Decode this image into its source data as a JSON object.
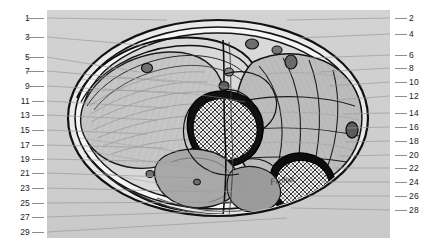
{
  "figure": {
    "signature": "Frohse",
    "plate_background_color": "#d0d0d0",
    "leader_line_color": "#8d8d8d",
    "label_text_color": "#222222",
    "page_background_color": "#ffffff"
  },
  "labels": {
    "left_column": [
      {
        "n": "1",
        "y": 18
      },
      {
        "n": "3",
        "y": 37
      },
      {
        "n": "5",
        "y": 57
      },
      {
        "n": "7",
        "y": 71
      },
      {
        "n": "9",
        "y": 86
      },
      {
        "n": "11",
        "y": 101
      },
      {
        "n": "13",
        "y": 115
      },
      {
        "n": "15",
        "y": 130
      },
      {
        "n": "17",
        "y": 145
      },
      {
        "n": "19",
        "y": 159
      },
      {
        "n": "21",
        "y": 173
      },
      {
        "n": "23",
        "y": 188
      },
      {
        "n": "25",
        "y": 203
      },
      {
        "n": "27",
        "y": 217
      },
      {
        "n": "29",
        "y": 232
      }
    ],
    "right_column": [
      {
        "n": "2",
        "y": 18
      },
      {
        "n": "4",
        "y": 34
      },
      {
        "n": "6",
        "y": 55
      },
      {
        "n": "8",
        "y": 68
      },
      {
        "n": "10",
        "y": 82
      },
      {
        "n": "12",
        "y": 96
      },
      {
        "n": "14",
        "y": 113
      },
      {
        "n": "16",
        "y": 127
      },
      {
        "n": "18",
        "y": 141
      },
      {
        "n": "20",
        "y": 155
      },
      {
        "n": "22",
        "y": 168
      },
      {
        "n": "24",
        "y": 182
      },
      {
        "n": "26",
        "y": 196
      },
      {
        "n": "28",
        "y": 210
      }
    ]
  }
}
